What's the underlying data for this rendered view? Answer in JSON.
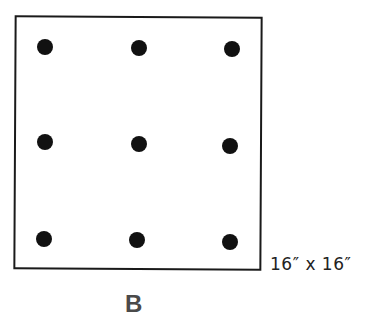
{
  "figure": {
    "label": "B",
    "dimension_text": "16″ x 16″",
    "board_color": "#ffffff",
    "border_color": "#1a1a1a",
    "dot_color": "#111111",
    "dots": [
      {
        "row": 1,
        "col": 1,
        "x": 45,
        "y": 47
      },
      {
        "row": 1,
        "col": 2,
        "x": 139,
        "y": 48
      },
      {
        "row": 1,
        "col": 3,
        "x": 232,
        "y": 49
      },
      {
        "row": 2,
        "col": 1,
        "x": 45,
        "y": 142
      },
      {
        "row": 2,
        "col": 2,
        "x": 139,
        "y": 144
      },
      {
        "row": 2,
        "col": 3,
        "x": 230,
        "y": 146
      },
      {
        "row": 3,
        "col": 1,
        "x": 44,
        "y": 239
      },
      {
        "row": 3,
        "col": 2,
        "x": 137,
        "y": 240
      },
      {
        "row": 3,
        "col": 3,
        "x": 230,
        "y": 242
      }
    ]
  }
}
